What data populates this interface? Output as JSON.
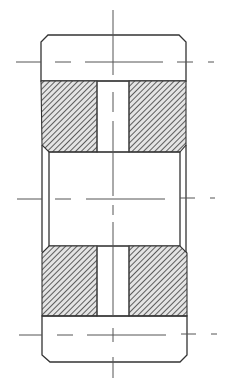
{
  "drawing": {
    "type": "engineering-section-view",
    "title": "",
    "colors": {
      "background": "#ffffff",
      "line": "#333333",
      "hatch": "#444444",
      "hatch_bg": "#dcdcdc"
    },
    "parts": [
      {
        "name": "top-ring",
        "label": ""
      },
      {
        "name": "upper-left-hatched-block",
        "label": ""
      },
      {
        "name": "upper-right-hatched-block",
        "label": ""
      },
      {
        "name": "central-bore",
        "label": ""
      },
      {
        "name": "lower-left-hatched-block",
        "label": ""
      },
      {
        "name": "lower-right-hatched-block",
        "label": ""
      },
      {
        "name": "bottom-ring",
        "label": ""
      },
      {
        "name": "center-slot",
        "label": ""
      }
    ],
    "centerlines": {
      "vertical_x": 113,
      "horizontal_y": [
        62,
        199,
        335
      ]
    }
  }
}
